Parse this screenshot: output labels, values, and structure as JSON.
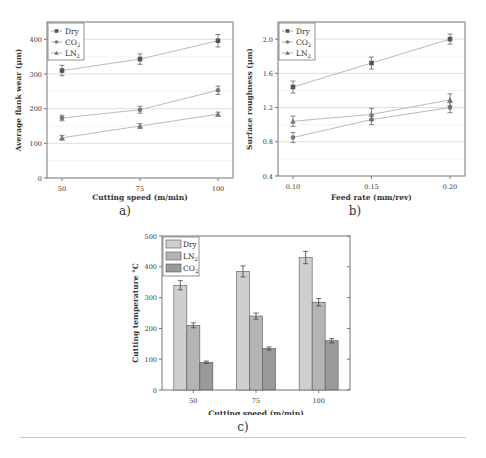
{
  "chart_data": [
    {
      "id": "a",
      "type": "line",
      "caption": "a)",
      "title": "",
      "xlabel": "Cutting speed (m/min)",
      "ylabel": "Average flank wear (μm)",
      "categories": [
        "50",
        "75",
        "100"
      ],
      "x": [
        50,
        75,
        100
      ],
      "ylim": [
        0,
        450
      ],
      "yticks": [
        0,
        100,
        200,
        300,
        400
      ],
      "grid": true,
      "legend_position": "upper-left",
      "series": [
        {
          "name": "Dry",
          "marker": "square",
          "values": [
            310,
            343,
            396
          ],
          "errors": [
            15,
            15,
            18
          ]
        },
        {
          "name": "CO2",
          "marker": "circle",
          "values": [
            173,
            197,
            253
          ],
          "errors": [
            8,
            10,
            12
          ]
        },
        {
          "name": "LN2",
          "marker": "triangle",
          "values": [
            116,
            150,
            184
          ],
          "errors": [
            7,
            7,
            6
          ]
        }
      ]
    },
    {
      "id": "b",
      "type": "line",
      "caption": "b)",
      "title": "",
      "xlabel": "Feed rate (mm/rev)",
      "ylabel": "Surface roughness (μm)",
      "categories": [
        "0.10",
        "0.15",
        "0.20"
      ],
      "x": [
        0.1,
        0.15,
        0.2
      ],
      "ylim": [
        0.4,
        2.2
      ],
      "yticks": [
        0.4,
        0.8,
        1.2,
        1.6,
        2.0
      ],
      "grid": true,
      "legend_position": "upper-left",
      "series": [
        {
          "name": "Dry",
          "marker": "square",
          "values": [
            1.44,
            1.72,
            2.0
          ],
          "errors": [
            0.07,
            0.07,
            0.06
          ]
        },
        {
          "name": "CO2",
          "marker": "circle",
          "values": [
            0.85,
            1.06,
            1.2
          ],
          "errors": [
            0.06,
            0.06,
            0.06
          ]
        },
        {
          "name": "LN2",
          "marker": "triangle",
          "values": [
            1.04,
            1.12,
            1.29
          ],
          "errors": [
            0.06,
            0.07,
            0.07
          ]
        }
      ]
    },
    {
      "id": "c",
      "type": "bar",
      "caption": "c)",
      "title": "",
      "xlabel": "Cutting speed (m/min)",
      "ylabel": "Cutting temperature °C",
      "categories": [
        "50",
        "75",
        "100"
      ],
      "ylim": [
        0,
        500
      ],
      "yticks": [
        0,
        100,
        200,
        300,
        400,
        500
      ],
      "grid": false,
      "legend_position": "upper-left",
      "series": [
        {
          "name": "Dry",
          "color": "#cfcfcf",
          "values": [
            340,
            385,
            430
          ],
          "errors": [
            15,
            18,
            20
          ]
        },
        {
          "name": "LN2",
          "color": "#b4b4b4",
          "values": [
            210,
            240,
            285
          ],
          "errors": [
            8,
            10,
            12
          ]
        },
        {
          "name": "CO2",
          "color": "#999999",
          "values": [
            90,
            135,
            160
          ],
          "errors": [
            4,
            5,
            7
          ]
        }
      ]
    }
  ]
}
